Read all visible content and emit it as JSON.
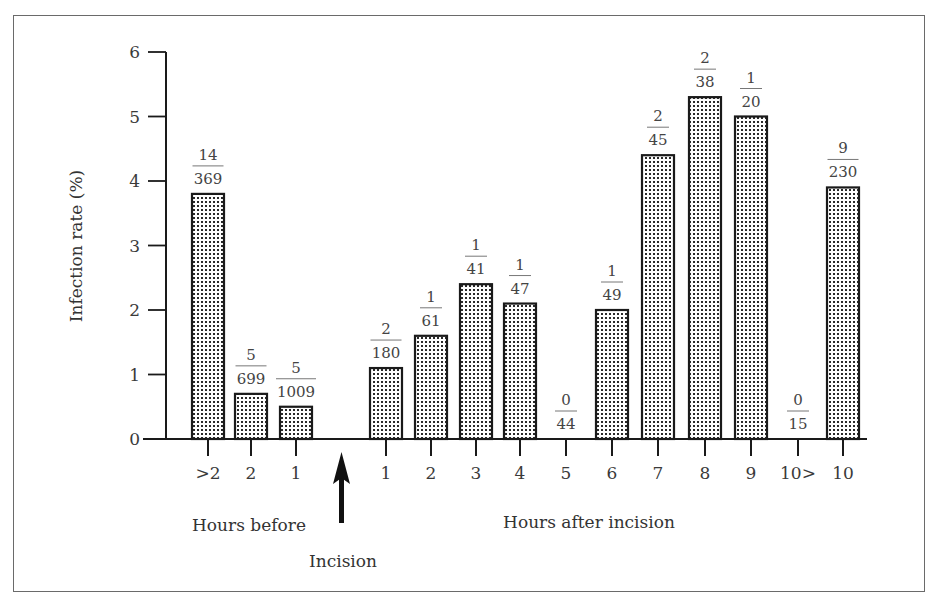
{
  "chart_data": {
    "type": "bar",
    "title": "",
    "xlabel_groups": [
      "Hours before",
      "Hours after incision"
    ],
    "ylabel": "Infection rate (%)",
    "ylim": [
      0,
      6
    ],
    "yticks": [
      "0",
      "1",
      "2",
      "3",
      "4",
      "5",
      "6"
    ],
    "grid": false,
    "legend": null,
    "annotation": "Incision",
    "categories": [
      ">2",
      "2",
      "1",
      "1",
      "2",
      "3",
      "4",
      "5",
      "6",
      "7",
      "8",
      "9",
      "10>",
      "10"
    ],
    "groups": [
      "before",
      "before",
      "before",
      "after",
      "after",
      "after",
      "after",
      "after",
      "after",
      "after",
      "after",
      "after",
      "after",
      "after"
    ],
    "values": [
      3.8,
      0.7,
      0.5,
      1.1,
      1.6,
      2.4,
      2.1,
      0.0,
      2.0,
      4.4,
      5.3,
      5.0,
      0.0,
      3.9
    ],
    "numerators": [
      "14",
      "5",
      "5",
      "2",
      "1",
      "1",
      "1",
      "0",
      "1",
      "2",
      "2",
      "1",
      "0",
      "9"
    ],
    "denominators": [
      "369",
      "699",
      "1009",
      "180",
      "61",
      "41",
      "47",
      "44",
      "49",
      "45",
      "38",
      "20",
      "15",
      "230"
    ]
  },
  "labels": {
    "y_axis_title": "Infection rate (%)",
    "hours_before": "Hours before",
    "hours_after": "Hours after incision",
    "incision": "Incision"
  },
  "colors": {
    "bar_fill": "#ffffff",
    "bar_dots": "#2a2a2a",
    "bar_outline": "#1a1a1a",
    "axis": "#1a1a1a",
    "frame": "#6a6a6a"
  }
}
